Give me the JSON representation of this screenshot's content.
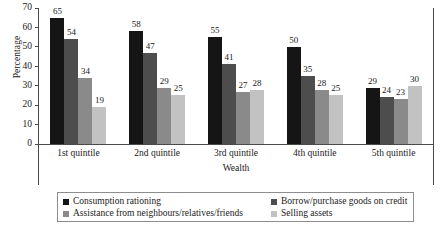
{
  "chart_data": {
    "type": "bar",
    "title": "",
    "xlabel": "Wealth",
    "ylabel": "Percentage",
    "ylim": [
      0,
      70
    ],
    "yticks": [
      0,
      10,
      20,
      30,
      40,
      50,
      60,
      70
    ],
    "grid": false,
    "legend_position": "bottom",
    "categories": [
      "1st quintile",
      "2nd quintile",
      "3rd quintile",
      "4th quintile",
      "5th quintile"
    ],
    "series": [
      {
        "name": "Consumption rationing",
        "color": "#151515",
        "values": [
          65,
          58,
          55,
          50,
          29
        ]
      },
      {
        "name": "Borrow/purchase goods on credit",
        "color": "#4d4d4d",
        "values": [
          54,
          47,
          41,
          35,
          24
        ]
      },
      {
        "name": "Assistance from neighbours/relatives/friends",
        "color": "#8a8a8a",
        "values": [
          34,
          29,
          27,
          28,
          23
        ]
      },
      {
        "name": "Selling assets",
        "color": "#c2c2c2",
        "values": [
          19,
          25,
          28,
          25,
          30
        ]
      }
    ]
  },
  "axis": {
    "y_title": "Percentage",
    "x_title": "Wealth"
  }
}
